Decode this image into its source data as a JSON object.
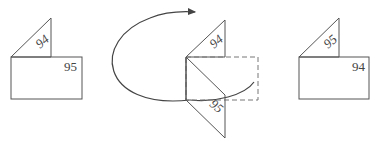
{
  "diagram": {
    "left_figure": {
      "flap_label": "94",
      "page_label": "95"
    },
    "middle_figure": {
      "top_label": "94",
      "bottom_label": "95",
      "rotation_arrow": "curved-arrow"
    },
    "right_figure": {
      "flap_label": "95",
      "page_label": "94"
    },
    "colors": {
      "stroke": "#555555",
      "dashed": "#777777",
      "background": "#ffffff"
    }
  }
}
